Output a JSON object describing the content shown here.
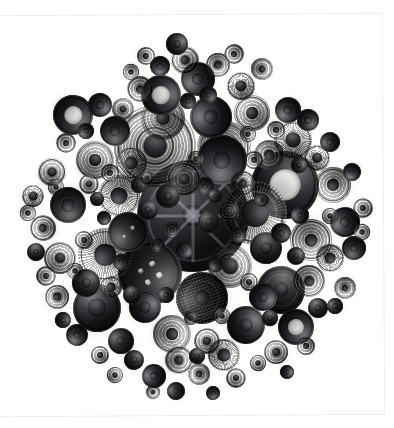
{
  "image": {
    "title": "Black Buttons",
    "subject": "collection of vintage black buttons arranged in a circular mandala",
    "background_color": "#ffffff",
    "frame_color": "#eeeef0",
    "canvas": {
      "width": 394,
      "height": 428
    },
    "composition": {
      "arrangement": "circular cluster",
      "center_x": 193,
      "center_y": 216,
      "radius": 178,
      "button_count": 132,
      "dominant_color": "#1a1a1e",
      "highlight_color": "#4a4a50",
      "shadow_color": "#28282c"
    }
  },
  "palette": {
    "paper": "#ffffff",
    "button_dark": "#121216",
    "button_mid": "#2e2e34",
    "button_light": "#4a4a50",
    "hole_white": "#f2f2f2",
    "border": "#eeeef0"
  },
  "buttons": [
    {
      "x": 193,
      "y": 216,
      "r": 56,
      "tex": "t-spoke",
      "ring": 0,
      "boss": 0.1,
      "holes": 0
    },
    {
      "x": 155,
      "y": 146,
      "r": 41,
      "tex": "t-rings",
      "ring": 3,
      "boss": 0.14,
      "holes": 0
    },
    {
      "x": 285,
      "y": 185,
      "r": 34,
      "tex": "t-donut",
      "ring": 1,
      "boss": 0,
      "holes": 0,
      "punch": 0.46
    },
    {
      "x": 255,
      "y": 213,
      "r": 32,
      "tex": "t-ridge",
      "ring": 2,
      "boss": 0.22,
      "holes": 0
    },
    {
      "x": 150,
      "y": 273,
      "r": 32,
      "tex": "t-plain",
      "ring": 1,
      "boss": 0,
      "holes": 4
    },
    {
      "x": 224,
      "y": 148,
      "r": 27,
      "tex": "t-rings",
      "ring": 2,
      "boss": 0.16,
      "holes": 0
    },
    {
      "x": 222,
      "y": 160,
      "r": 25,
      "tex": "t-dome",
      "ring": 1,
      "boss": 0.18,
      "holes": 0
    },
    {
      "x": 105,
      "y": 255,
      "r": 27,
      "tex": "t-ridge",
      "ring": 2,
      "boss": 0.2,
      "holes": 0
    },
    {
      "x": 202,
      "y": 298,
      "r": 26,
      "tex": "t-grid",
      "ring": 2,
      "boss": 0.14,
      "holes": 0
    },
    {
      "x": 163,
      "y": 118,
      "r": 22,
      "tex": "t-rings",
      "ring": 2,
      "boss": 0.16,
      "holes": 0
    },
    {
      "x": 97,
      "y": 308,
      "r": 24,
      "tex": "t-dome",
      "ring": 1,
      "boss": 0.2,
      "holes": 0
    },
    {
      "x": 281,
      "y": 290,
      "r": 24,
      "tex": "t-plain",
      "ring": 2,
      "boss": 0.16,
      "holes": 0
    },
    {
      "x": 230,
      "y": 266,
      "r": 22,
      "tex": "t-rings",
      "ring": 2,
      "boss": 0.18,
      "holes": 0
    },
    {
      "x": 161,
      "y": 95,
      "r": 20,
      "tex": "t-donut",
      "ring": 1,
      "boss": 0,
      "holes": 0,
      "punch": 0.44
    },
    {
      "x": 73,
      "y": 115,
      "r": 20,
      "tex": "t-donut",
      "ring": 1,
      "boss": 0,
      "holes": 0,
      "punch": 0.46
    },
    {
      "x": 311,
      "y": 240,
      "r": 21,
      "tex": "t-rings",
      "ring": 2,
      "boss": 0.16,
      "holes": 0
    },
    {
      "x": 119,
      "y": 196,
      "r": 21,
      "tex": "t-ridge",
      "ring": 1,
      "boss": 0.2,
      "holes": 0
    },
    {
      "x": 128,
      "y": 232,
      "r": 20,
      "tex": "t-plain",
      "ring": 1,
      "boss": 0,
      "holes": 2
    },
    {
      "x": 211,
      "y": 117,
      "r": 21,
      "tex": "t-dome",
      "ring": 1,
      "boss": 0.18,
      "holes": 0
    },
    {
      "x": 252,
      "y": 113,
      "r": 18,
      "tex": "t-rings",
      "ring": 2,
      "boss": 0.16,
      "holes": 0
    },
    {
      "x": 293,
      "y": 140,
      "r": 19,
      "tex": "t-ridge",
      "ring": 1,
      "boss": 0.2,
      "holes": 0
    },
    {
      "x": 95,
      "y": 160,
      "r": 19,
      "tex": "t-rings",
      "ring": 2,
      "boss": 0.16,
      "holes": 0
    },
    {
      "x": 246,
      "y": 325,
      "r": 19,
      "tex": "t-dome",
      "ring": 1,
      "boss": 0.18,
      "holes": 0
    },
    {
      "x": 172,
      "y": 334,
      "r": 19,
      "tex": "t-rings",
      "ring": 2,
      "boss": 0.16,
      "holes": 0
    },
    {
      "x": 296,
      "y": 327,
      "r": 18,
      "tex": "t-donut",
      "ring": 1,
      "boss": 0,
      "holes": 0,
      "punch": 0.44
    },
    {
      "x": 68,
      "y": 205,
      "r": 18,
      "tex": "t-plain",
      "ring": 1,
      "boss": 0.2,
      "holes": 0
    },
    {
      "x": 333,
      "y": 185,
      "r": 18,
      "tex": "t-rings",
      "ring": 2,
      "boss": 0.16,
      "holes": 0
    },
    {
      "x": 198,
      "y": 79,
      "r": 17,
      "tex": "t-dome",
      "ring": 1,
      "boss": 0.18,
      "holes": 0
    },
    {
      "x": 131,
      "y": 163,
      "r": 16,
      "tex": "t-ridge",
      "ring": 1,
      "boss": 0.2,
      "holes": 0
    },
    {
      "x": 184,
      "y": 179,
      "r": 17,
      "tex": "t-rings",
      "ring": 2,
      "boss": 0.14,
      "holes": 0
    },
    {
      "x": 266,
      "y": 248,
      "r": 16,
      "tex": "t-plain",
      "ring": 1,
      "boss": 0.18,
      "holes": 0
    },
    {
      "x": 60,
      "y": 258,
      "r": 16,
      "tex": "t-rings",
      "ring": 2,
      "boss": 0.16,
      "holes": 0
    },
    {
      "x": 145,
      "y": 307,
      "r": 16,
      "tex": "t-dome",
      "ring": 1,
      "boss": 0.18,
      "holes": 0
    },
    {
      "x": 224,
      "y": 355,
      "r": 16,
      "tex": "t-ridge",
      "ring": 1,
      "boss": 0.2,
      "holes": 0
    },
    {
      "x": 309,
      "y": 281,
      "r": 16,
      "tex": "t-rings",
      "ring": 2,
      "boss": 0.16,
      "holes": 0
    },
    {
      "x": 115,
      "y": 131,
      "r": 15,
      "tex": "t-plain",
      "ring": 1,
      "boss": 0.18,
      "holes": 0
    },
    {
      "x": 269,
      "y": 155,
      "r": 15,
      "tex": "t-rings",
      "ring": 2,
      "boss": 0.16,
      "holes": 0
    },
    {
      "x": 345,
      "y": 222,
      "r": 15,
      "tex": "t-dome",
      "ring": 1,
      "boss": 0.18,
      "holes": 0
    },
    {
      "x": 185,
      "y": 60,
      "r": 14,
      "tex": "t-rings",
      "ring": 2,
      "boss": 0.16,
      "holes": 0
    },
    {
      "x": 241,
      "y": 86,
      "r": 14,
      "tex": "t-ridge",
      "ring": 1,
      "boss": 0.2,
      "holes": 0
    },
    {
      "x": 52,
      "y": 172,
      "r": 14,
      "tex": "t-rings",
      "ring": 2,
      "boss": 0.16,
      "holes": 0
    },
    {
      "x": 86,
      "y": 283,
      "r": 14,
      "tex": "t-plain",
      "ring": 1,
      "boss": 0.18,
      "holes": 0
    },
    {
      "x": 179,
      "y": 360,
      "r": 14,
      "tex": "t-rings",
      "ring": 2,
      "boss": 0.16,
      "holes": 0
    },
    {
      "x": 263,
      "y": 297,
      "r": 14,
      "tex": "t-dome",
      "ring": 1,
      "boss": 0.18,
      "holes": 0
    },
    {
      "x": 330,
      "y": 258,
      "r": 14,
      "tex": "t-ridge",
      "ring": 1,
      "boss": 0.2,
      "holes": 0
    },
    {
      "x": 140,
      "y": 89,
      "r": 13,
      "tex": "t-rings",
      "ring": 2,
      "boss": 0.16,
      "holes": 0
    },
    {
      "x": 288,
      "y": 110,
      "r": 13,
      "tex": "t-dome",
      "ring": 1,
      "boss": 0.18,
      "holes": 0
    },
    {
      "x": 43,
      "y": 228,
      "r": 13,
      "tex": "t-rings",
      "ring": 2,
      "boss": 0.16,
      "holes": 0
    },
    {
      "x": 121,
      "y": 341,
      "r": 13,
      "tex": "t-plain",
      "ring": 1,
      "boss": 0.18,
      "holes": 0
    },
    {
      "x": 207,
      "y": 341,
      "r": 13,
      "tex": "t-rings",
      "ring": 2,
      "boss": 0.16,
      "holes": 0
    },
    {
      "x": 317,
      "y": 158,
      "r": 13,
      "tex": "t-ridge",
      "ring": 1,
      "boss": 0.2,
      "holes": 0
    },
    {
      "x": 168,
      "y": 196,
      "r": 12,
      "tex": "t-plain",
      "ring": 1,
      "boss": 0.18,
      "holes": 0
    },
    {
      "x": 243,
      "y": 183,
      "r": 12,
      "tex": "t-rings",
      "ring": 2,
      "boss": 0.16,
      "holes": 0
    },
    {
      "x": 100,
      "y": 105,
      "r": 12,
      "tex": "t-dome",
      "ring": 1,
      "boss": 0.18,
      "holes": 0
    },
    {
      "x": 218,
      "y": 65,
      "r": 12,
      "tex": "t-rings",
      "ring": 2,
      "boss": 0.16,
      "holes": 0
    },
    {
      "x": 354,
      "y": 248,
      "r": 12,
      "tex": "t-plain",
      "ring": 1,
      "boss": 0.18,
      "holes": 0
    },
    {
      "x": 57,
      "y": 297,
      "r": 12,
      "tex": "t-rings",
      "ring": 2,
      "boss": 0.16,
      "holes": 0
    },
    {
      "x": 154,
      "y": 376,
      "r": 12,
      "tex": "t-dome",
      "ring": 1,
      "boss": 0.18,
      "holes": 0
    },
    {
      "x": 276,
      "y": 352,
      "r": 12,
      "tex": "t-rings",
      "ring": 2,
      "boss": 0.16,
      "holes": 0
    },
    {
      "x": 33,
      "y": 196,
      "r": 11,
      "tex": "t-ridge",
      "ring": 1,
      "boss": 0.2,
      "holes": 0
    },
    {
      "x": 123,
      "y": 109,
      "r": 11,
      "tex": "t-rings",
      "ring": 2,
      "boss": 0.16,
      "holes": 0
    },
    {
      "x": 177,
      "y": 44,
      "r": 11,
      "tex": "t-dome",
      "ring": 1,
      "boss": 0.18,
      "holes": 0
    },
    {
      "x": 262,
      "y": 69,
      "r": 11,
      "tex": "t-rings",
      "ring": 2,
      "boss": 0.16,
      "holes": 0
    },
    {
      "x": 308,
      "y": 120,
      "r": 11,
      "tex": "t-plain",
      "ring": 1,
      "boss": 0.18,
      "holes": 0
    },
    {
      "x": 345,
      "y": 288,
      "r": 11,
      "tex": "t-rings",
      "ring": 2,
      "boss": 0.16,
      "holes": 0
    },
    {
      "x": 77,
      "y": 335,
      "r": 11,
      "tex": "t-dome",
      "ring": 1,
      "boss": 0.18,
      "holes": 0
    },
    {
      "x": 199,
      "y": 374,
      "r": 11,
      "tex": "t-rings",
      "ring": 2,
      "boss": 0.16,
      "holes": 0
    },
    {
      "x": 111,
      "y": 287,
      "r": 11,
      "tex": "t-ridge",
      "ring": 1,
      "boss": 0.2,
      "holes": 0
    },
    {
      "x": 209,
      "y": 222,
      "r": 11,
      "tex": "t-plain",
      "ring": 1,
      "boss": 0.18,
      "holes": 0
    },
    {
      "x": 89,
      "y": 184,
      "r": 10,
      "tex": "t-rings",
      "ring": 1,
      "boss": 0.18,
      "holes": 0
    },
    {
      "x": 148,
      "y": 210,
      "r": 10,
      "tex": "t-dome",
      "ring": 1,
      "boss": 0.18,
      "holes": 0
    },
    {
      "x": 229,
      "y": 211,
      "r": 10,
      "tex": "t-rings",
      "ring": 1,
      "boss": 0.16,
      "holes": 0
    },
    {
      "x": 281,
      "y": 233,
      "r": 10,
      "tex": "t-plain",
      "ring": 1,
      "boss": 0.18,
      "holes": 0
    },
    {
      "x": 66,
      "y": 143,
      "r": 10,
      "tex": "t-rings",
      "ring": 1,
      "boss": 0.16,
      "holes": 0
    },
    {
      "x": 160,
      "y": 66,
      "r": 10,
      "tex": "t-dome",
      "ring": 1,
      "boss": 0.18,
      "holes": 0
    },
    {
      "x": 234,
      "y": 54,
      "r": 10,
      "tex": "t-rings",
      "ring": 1,
      "boss": 0.16,
      "holes": 0
    },
    {
      "x": 330,
      "y": 142,
      "r": 10,
      "tex": "t-plain",
      "ring": 1,
      "boss": 0.18,
      "holes": 0
    },
    {
      "x": 363,
      "y": 208,
      "r": 10,
      "tex": "t-rings",
      "ring": 1,
      "boss": 0.16,
      "holes": 0
    },
    {
      "x": 318,
      "y": 308,
      "r": 10,
      "tex": "t-dome",
      "ring": 1,
      "boss": 0.18,
      "holes": 0
    },
    {
      "x": 236,
      "y": 378,
      "r": 10,
      "tex": "t-rings",
      "ring": 1,
      "boss": 0.16,
      "holes": 0
    },
    {
      "x": 134,
      "y": 360,
      "r": 10,
      "tex": "t-plain",
      "ring": 1,
      "boss": 0.18,
      "holes": 0
    },
    {
      "x": 46,
      "y": 276,
      "r": 10,
      "tex": "t-rings",
      "ring": 1,
      "boss": 0.16,
      "holes": 0
    },
    {
      "x": 184,
      "y": 250,
      "r": 9,
      "tex": "t-dome",
      "ring": 1,
      "boss": 0.18,
      "holes": 0
    },
    {
      "x": 110,
      "y": 173,
      "r": 9,
      "tex": "t-rings",
      "ring": 1,
      "boss": 0.16,
      "holes": 0
    },
    {
      "x": 205,
      "y": 186,
      "r": 9,
      "tex": "t-plain",
      "ring": 1,
      "boss": 0.18,
      "holes": 0
    },
    {
      "x": 254,
      "y": 160,
      "r": 9,
      "tex": "t-rings",
      "ring": 1,
      "boss": 0.16,
      "holes": 0
    },
    {
      "x": 300,
      "y": 215,
      "r": 9,
      "tex": "t-dome",
      "ring": 1,
      "boss": 0.18,
      "holes": 0
    },
    {
      "x": 84,
      "y": 240,
      "r": 9,
      "tex": "t-rings",
      "ring": 1,
      "boss": 0.16,
      "holes": 0
    },
    {
      "x": 132,
      "y": 295,
      "r": 9,
      "tex": "t-plain",
      "ring": 1,
      "boss": 0.18,
      "holes": 0
    },
    {
      "x": 249,
      "y": 282,
      "r": 9,
      "tex": "t-rings",
      "ring": 1,
      "boss": 0.16,
      "holes": 0
    },
    {
      "x": 296,
      "y": 256,
      "r": 9,
      "tex": "t-dome",
      "ring": 1,
      "boss": 0.18,
      "holes": 0
    },
    {
      "x": 146,
      "y": 56,
      "r": 9,
      "tex": "t-rings",
      "ring": 1,
      "boss": 0.16,
      "holes": 0
    },
    {
      "x": 208,
      "y": 95,
      "r": 9,
      "tex": "t-plain",
      "ring": 1,
      "boss": 0.18,
      "holes": 0
    },
    {
      "x": 276,
      "y": 130,
      "r": 9,
      "tex": "t-rings",
      "ring": 1,
      "boss": 0.16,
      "holes": 0
    },
    {
      "x": 352,
      "y": 172,
      "r": 9,
      "tex": "t-dome",
      "ring": 1,
      "boss": 0.18,
      "holes": 0
    },
    {
      "x": 306,
      "y": 346,
      "r": 9,
      "tex": "t-rings",
      "ring": 1,
      "boss": 0.16,
      "holes": 0
    },
    {
      "x": 176,
      "y": 391,
      "r": 9,
      "tex": "t-plain",
      "ring": 1,
      "boss": 0.18,
      "holes": 0
    },
    {
      "x": 100,
      "y": 355,
      "r": 9,
      "tex": "t-rings",
      "ring": 1,
      "boss": 0.16,
      "holes": 0
    },
    {
      "x": 36,
      "y": 252,
      "r": 9,
      "tex": "t-dome",
      "ring": 1,
      "boss": 0.18,
      "holes": 0
    },
    {
      "x": 56,
      "y": 187,
      "r": 8,
      "tex": "t-rings",
      "ring": 1,
      "boss": 0.16,
      "holes": 0
    },
    {
      "x": 139,
      "y": 185,
      "r": 8,
      "tex": "t-plain",
      "ring": 1,
      "boss": 0.18,
      "holes": 0
    },
    {
      "x": 196,
      "y": 159,
      "r": 8,
      "tex": "t-rings",
      "ring": 1,
      "boss": 0.16,
      "holes": 0
    },
    {
      "x": 238,
      "y": 235,
      "r": 8,
      "tex": "t-dome",
      "ring": 1,
      "boss": 0.18,
      "holes": 0
    },
    {
      "x": 172,
      "y": 230,
      "r": 8,
      "tex": "t-rings",
      "ring": 1,
      "boss": 0.16,
      "holes": 0
    },
    {
      "x": 121,
      "y": 262,
      "r": 8,
      "tex": "t-plain",
      "ring": 1,
      "boss": 0.18,
      "holes": 0
    },
    {
      "x": 75,
      "y": 271,
      "r": 8,
      "tex": "t-rings",
      "ring": 1,
      "boss": 0.16,
      "holes": 0
    },
    {
      "x": 166,
      "y": 295,
      "r": 8,
      "tex": "t-dome",
      "ring": 1,
      "boss": 0.18,
      "holes": 0
    },
    {
      "x": 222,
      "y": 316,
      "r": 8,
      "tex": "t-rings",
      "ring": 1,
      "boss": 0.16,
      "holes": 0
    },
    {
      "x": 270,
      "y": 318,
      "r": 8,
      "tex": "t-plain",
      "ring": 1,
      "boss": 0.18,
      "holes": 0
    },
    {
      "x": 330,
      "y": 216,
      "r": 8,
      "tex": "t-rings",
      "ring": 1,
      "boss": 0.16,
      "holes": 0
    },
    {
      "x": 299,
      "y": 165,
      "r": 8,
      "tex": "t-dome",
      "ring": 1,
      "boss": 0.18,
      "holes": 0
    },
    {
      "x": 248,
      "y": 134,
      "r": 8,
      "tex": "t-rings",
      "ring": 1,
      "boss": 0.16,
      "holes": 0
    },
    {
      "x": 188,
      "y": 101,
      "r": 8,
      "tex": "t-plain",
      "ring": 1,
      "boss": 0.18,
      "holes": 0
    },
    {
      "x": 131,
      "y": 72,
      "r": 8,
      "tex": "t-rings",
      "ring": 1,
      "boss": 0.16,
      "holes": 0
    },
    {
      "x": 86,
      "y": 131,
      "r": 8,
      "tex": "t-dome",
      "ring": 1,
      "boss": 0.18,
      "holes": 0
    },
    {
      "x": 362,
      "y": 232,
      "r": 8,
      "tex": "t-rings",
      "ring": 1,
      "boss": 0.16,
      "holes": 0
    },
    {
      "x": 335,
      "y": 306,
      "r": 8,
      "tex": "t-plain",
      "ring": 1,
      "boss": 0.18,
      "holes": 0
    },
    {
      "x": 258,
      "y": 363,
      "r": 8,
      "tex": "t-rings",
      "ring": 1,
      "boss": 0.16,
      "holes": 0
    },
    {
      "x": 197,
      "y": 356,
      "r": 8,
      "tex": "t-dome",
      "ring": 1,
      "boss": 0.18,
      "holes": 0
    },
    {
      "x": 115,
      "y": 375,
      "r": 8,
      "tex": "t-rings",
      "ring": 1,
      "boss": 0.16,
      "holes": 0
    },
    {
      "x": 63,
      "y": 320,
      "r": 8,
      "tex": "t-plain",
      "ring": 1,
      "boss": 0.18,
      "holes": 0
    },
    {
      "x": 28,
      "y": 213,
      "r": 8,
      "tex": "t-rings",
      "ring": 1,
      "boss": 0.16,
      "holes": 0
    },
    {
      "x": 104,
      "y": 218,
      "r": 7,
      "tex": "t-dome",
      "ring": 1,
      "boss": 0.18,
      "holes": 0
    },
    {
      "x": 158,
      "y": 245,
      "r": 7,
      "tex": "t-rings",
      "ring": 1,
      "boss": 0.16,
      "holes": 0
    },
    {
      "x": 216,
      "y": 265,
      "r": 7,
      "tex": "t-plain",
      "ring": 1,
      "boss": 0.18,
      "holes": 0
    },
    {
      "x": 262,
      "y": 200,
      "r": 7,
      "tex": "t-rings",
      "ring": 1,
      "boss": 0.16,
      "holes": 0
    },
    {
      "x": 215,
      "y": 196,
      "r": 7,
      "tex": "t-dome",
      "ring": 1,
      "boss": 0.18,
      "holes": 0
    },
    {
      "x": 147,
      "y": 178,
      "r": 7,
      "tex": "t-rings",
      "ring": 1,
      "boss": 0.16,
      "holes": 0
    },
    {
      "x": 97,
      "y": 199,
      "r": 7,
      "tex": "t-plain",
      "ring": 1,
      "boss": 0.18,
      "holes": 0
    },
    {
      "x": 191,
      "y": 318,
      "r": 7,
      "tex": "t-rings",
      "ring": 1,
      "boss": 0.16,
      "holes": 0
    },
    {
      "x": 287,
      "y": 372,
      "r": 7,
      "tex": "t-dome",
      "ring": 1,
      "boss": 0.18,
      "holes": 0
    },
    {
      "x": 153,
      "y": 392,
      "r": 7,
      "tex": "t-rings",
      "ring": 1,
      "boss": 0.16,
      "holes": 0
    },
    {
      "x": 213,
      "y": 393,
      "r": 7,
      "tex": "t-plain",
      "ring": 1,
      "boss": 0.18,
      "holes": 0
    }
  ]
}
